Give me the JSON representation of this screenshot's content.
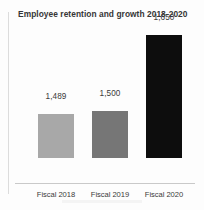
{
  "chart_data": {
    "type": "bar",
    "title": "Employee retention and growth 2018-2020",
    "xlabel": "",
    "ylabel": "",
    "categories": [
      "Fiscal 2018",
      "Fiscal 2019",
      "Fiscal 2020"
    ],
    "values": [
      1489,
      1500,
      1650
    ],
    "value_labels": [
      "1,489",
      "1,500",
      "1,650"
    ],
    "bar_colors": [
      "#a8a8a8",
      "#767676",
      "#0d0d0d"
    ],
    "grid": false,
    "legend": "none",
    "axis_baseline_visible": true,
    "ylim": [
      1430,
      1690
    ],
    "bars": [
      {
        "category": "Fiscal 2018",
        "value": 1489,
        "value_label": "1,489",
        "color": "#a8a8a8",
        "bar_height_px": 44,
        "label_offset_px": 57
      },
      {
        "category": "Fiscal 2019",
        "value": 1500,
        "value_label": "1,500",
        "color": "#767676",
        "bar_height_px": 47,
        "label_offset_px": 60
      },
      {
        "category": "Fiscal 2020",
        "value": 1650,
        "value_label": "1,650",
        "color": "#0d0d0d",
        "bar_height_px": 123,
        "label_offset_px": 136
      }
    ]
  },
  "colors": {
    "background": "#fdfdfd",
    "title_text": "#363636",
    "label_text": "#3a3a3a",
    "axis_line": "#c9c9c9",
    "page_edge": "#dcdcdc"
  }
}
